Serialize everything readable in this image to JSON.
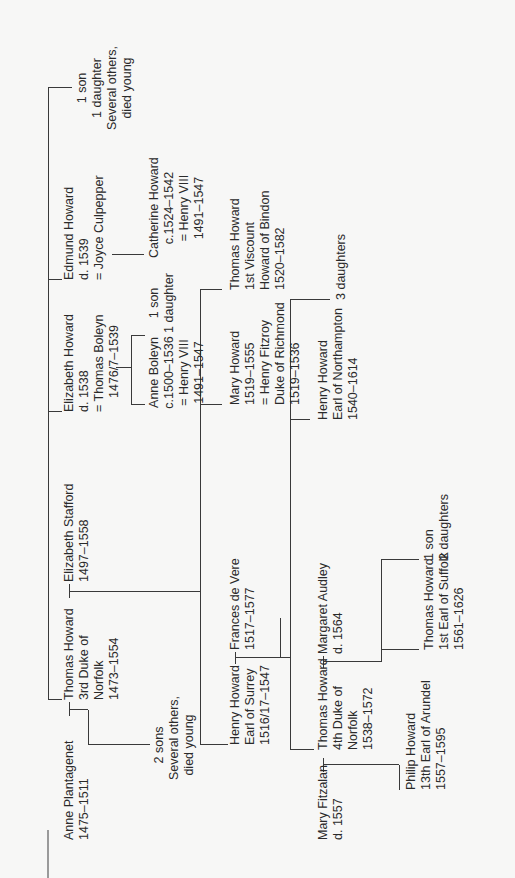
{
  "diagram": {
    "type": "family-tree",
    "orientation": "rotated-90-ccw",
    "line_color": "#3a3a3a",
    "background": "#f7f7f6",
    "generations": [
      {
        "people": {
          "anne_plantagenet": [
            "Anne Plantagenet",
            "1475–1511"
          ],
          "thomas_3rd_duke": [
            "Thomas Howard",
            "3rd Duke of",
            "Norfolk",
            "1473–1554"
          ],
          "children_1": [
            "2 sons",
            "Several others,",
            "died young"
          ],
          "elizabeth_stafford": [
            "Elizabeth Stafford",
            "1497–1558"
          ],
          "elizabeth_howard": [
            "Elizabeth Howard",
            "d. 1538",
            "= Thomas Boleyn",
            "1476/7–1539"
          ],
          "edmund_howard": [
            "Edmund Howard",
            "d. 1539",
            "= Joyce Culpepper"
          ],
          "others_top": [
            "1 son",
            "1 daughter",
            "Several others,",
            "died young"
          ]
        }
      },
      {
        "people": {
          "anne_boleyn": [
            "Anne Boleyn",
            "c.1500–1536",
            "= Henry VIII",
            "1491–1547"
          ],
          "boleyn_children": [
            "1 son",
            "1 daughter"
          ],
          "catherine_howard": [
            "Catherine Howard",
            "c.1524–1542",
            "= Henry VIII",
            "1491–1547"
          ],
          "henry_surrey": [
            "Henry Howard",
            "Earl of Surrey",
            "1516/17–1547"
          ],
          "frances_de_vere": [
            "Frances de Vere",
            "1517–1577"
          ],
          "mary_howard": [
            "Mary Howard",
            "1519–1555",
            "= Henry Fitzroy",
            "Duke of Richmond",
            "1519–1536"
          ],
          "thomas_bindon": [
            "Thomas Howard",
            "1st Viscount",
            "Howard of Bindon",
            "1520–1582"
          ]
        }
      },
      {
        "people": {
          "mary_fitzalan": [
            "Mary Fitzalan",
            "d. 1557"
          ],
          "thomas_4th_duke": [
            "Thomas Howard",
            "4th Duke of",
            "Norfolk",
            "1538–1572"
          ],
          "margaret_audley": [
            "Margaret Audley",
            "d. 1564"
          ],
          "henry_northampton": [
            "Henry Howard",
            "Earl of Northampton",
            "1540–1614"
          ],
          "three_daughters": [
            "3 daughters"
          ]
        }
      },
      {
        "people": {
          "philip_howard": [
            "Philip Howard",
            "13th Earl of Arundel",
            "1557–1595"
          ],
          "thomas_suffolk": [
            "Thomas Howard",
            "1st Earl of Suffolk",
            "1561–1626"
          ],
          "suffolk_siblings": [
            "1 son",
            "2 daughters"
          ]
        }
      }
    ]
  }
}
